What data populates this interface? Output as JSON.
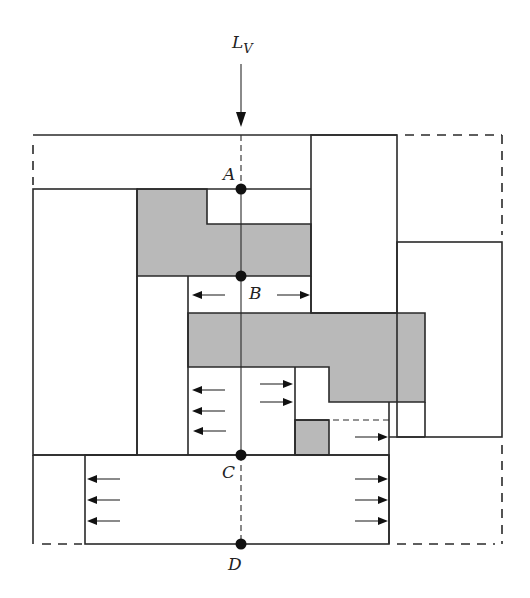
{
  "diagram": {
    "load_label": {
      "main": "L",
      "subscript": "V"
    },
    "points": [
      {
        "id": "A",
        "label": "A"
      },
      {
        "id": "B",
        "label": "B"
      },
      {
        "id": "C",
        "label": "C"
      },
      {
        "id": "D",
        "label": "D"
      }
    ],
    "colors": {
      "line": "#2a2a2a",
      "shaded_region": "#b9b9b9",
      "background": "#ffffff"
    }
  }
}
